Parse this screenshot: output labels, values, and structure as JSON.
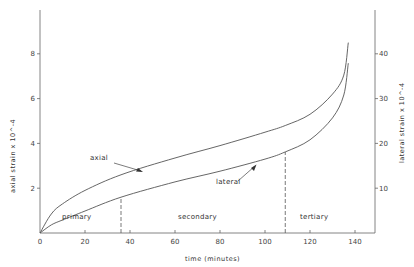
{
  "chart_data": {
    "type": "line",
    "title": "",
    "xlabel": "time (minutes)",
    "ylabel": "axial strain x 10^-4",
    "ylabel_right": "lateral strain x 10^-4",
    "x_ticks": [
      "0",
      "20",
      "40",
      "60",
      "80",
      "100",
      "120",
      "140"
    ],
    "y_ticks_left": [
      "2",
      "4",
      "6",
      "8"
    ],
    "y_ticks_right": [
      "10",
      "20",
      "30",
      "40"
    ],
    "xlim": [
      0,
      149
    ],
    "ylim_left": [
      0,
      10
    ],
    "ylim_right": [
      0,
      50
    ],
    "grid": false,
    "legend": "inline labels",
    "series": [
      {
        "name": "axial",
        "axis": "left",
        "x": [
          0,
          5,
          10,
          20,
          36,
          60,
          80,
          100,
          109,
          120,
          130,
          135,
          137
        ],
        "values": [
          0,
          0.85,
          1.3,
          1.9,
          2.6,
          3.35,
          3.9,
          4.5,
          4.8,
          5.3,
          6.2,
          7.05,
          8.5
        ]
      },
      {
        "name": "lateral",
        "axis": "right",
        "x": [
          0,
          5,
          10,
          20,
          36,
          60,
          80,
          100,
          109,
          120,
          130,
          135,
          137
        ],
        "values": [
          0,
          1.8,
          2.9,
          4.9,
          8.0,
          11.4,
          13.8,
          16.5,
          18.1,
          20.8,
          25.7,
          30.8,
          37.9
        ]
      }
    ],
    "annotations": [
      {
        "text": "primary",
        "x": 18,
        "region": [
          0,
          36
        ]
      },
      {
        "text": "secondary",
        "x": 72,
        "region": [
          36,
          109
        ]
      },
      {
        "text": "tertiary",
        "x": 124,
        "region": [
          109,
          149
        ]
      },
      {
        "text": "axial",
        "type": "arrow-label"
      },
      {
        "text": "lateral",
        "type": "arrow-label"
      }
    ],
    "dividers_minutes": [
      36,
      109
    ]
  }
}
